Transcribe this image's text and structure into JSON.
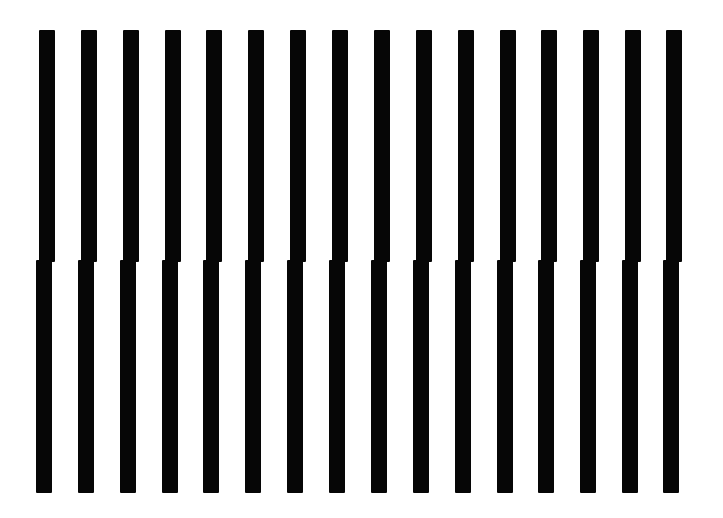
{
  "figure": {
    "background_color": "#ffffff",
    "bar_color": "#060606",
    "bar_count": 16,
    "bar_width": 16,
    "split_y": 261,
    "upper": {
      "top": 30,
      "bottom": 262,
      "x_starts": [
        39,
        81,
        123,
        165,
        206,
        248,
        290,
        332,
        374,
        416,
        458,
        500,
        541,
        583,
        625,
        666
      ]
    },
    "lower": {
      "top": 260,
      "bottom": 493,
      "x_starts": [
        36,
        78,
        120,
        162,
        203,
        245,
        287,
        329,
        371,
        413,
        455,
        497,
        538,
        580,
        622,
        663
      ]
    }
  }
}
